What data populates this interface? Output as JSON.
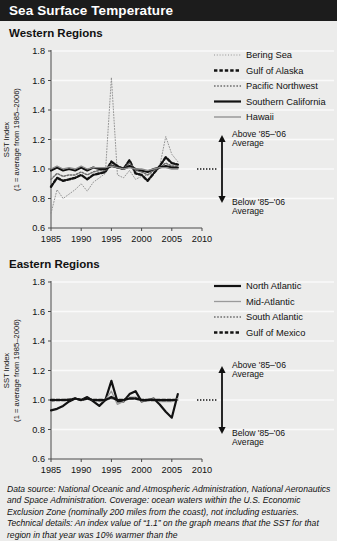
{
  "header": {
    "title": "Sea Surface Temperature"
  },
  "sections": {
    "west": "Western Regions",
    "east": "Eastern Regions"
  },
  "annotations": {
    "above_line1": "Above '85–'06",
    "above_line2": "Average",
    "below_line1": "Below '85–'06",
    "below_line2": "Average"
  },
  "axis": {
    "ylabel_line1": "SST Index",
    "ylabel_line2": "(1 = average from 1985–2006)",
    "yticks": [
      "1.8",
      "1.6",
      "1.4",
      "1.2",
      "1.0",
      "0.8",
      "0.6"
    ],
    "xticks": [
      "1985",
      "1990",
      "1995",
      "2000",
      "2005",
      "2010"
    ]
  },
  "footnote": "Data source: National Oceanic and Atmospheric Administration, National Aeronautics and Space Administration. Coverage: ocean waters within the U.S. Economic Exclusion Zone (nominally 200 miles from the coast), not including estuaries. Technical details: An index value of “1.1” on the graph means that the SST for that region in that year was 10% warmer than the",
  "chart_data": [
    {
      "type": "line",
      "title": "Western Regions",
      "xlabel": "",
      "ylabel": "SST Index (1 = average from 1985–2006)",
      "xlim": [
        1985,
        2010
      ],
      "ylim": [
        0.6,
        1.8
      ],
      "yticks": [
        0.6,
        0.8,
        1.0,
        1.2,
        1.4,
        1.6,
        1.8
      ],
      "xticks": [
        1985,
        1990,
        1995,
        2000,
        2005,
        2010
      ],
      "grid": "horizontal",
      "legend_position": "top-right",
      "reference_line": 1.0,
      "x": [
        1985,
        1986,
        1987,
        1988,
        1989,
        1990,
        1991,
        1992,
        1993,
        1994,
        1995,
        1996,
        1997,
        1998,
        1999,
        2000,
        2001,
        2002,
        2003,
        2004,
        2005,
        2006
      ],
      "series": [
        {
          "name": "Bering Sea",
          "style": "fine-dotted",
          "color": "#8b8b8b",
          "values": [
            0.7,
            0.86,
            0.8,
            0.83,
            0.86,
            0.9,
            0.85,
            0.91,
            0.94,
            0.97,
            1.62,
            0.96,
            0.94,
            0.99,
            0.93,
            0.95,
            0.96,
            0.97,
            1.02,
            1.22,
            1.1,
            1.05
          ]
        },
        {
          "name": "Gulf of Alaska",
          "style": "thick-dashed",
          "color": "#121212",
          "values": [
            0.88,
            0.94,
            0.92,
            0.93,
            0.94,
            0.96,
            0.93,
            0.96,
            0.97,
            0.98,
            1.05,
            1.02,
            1.0,
            1.06,
            0.97,
            0.96,
            0.92,
            0.97,
            1.02,
            1.08,
            1.04,
            1.03
          ]
        },
        {
          "name": "Pacific Northwest",
          "style": "dot-dash",
          "color": "#6e6e6e",
          "values": [
            0.93,
            0.97,
            0.95,
            0.96,
            0.96,
            0.98,
            0.96,
            0.98,
            0.99,
            0.99,
            1.03,
            1.01,
            1.0,
            1.04,
            0.99,
            0.98,
            0.96,
            0.99,
            1.01,
            1.04,
            1.02,
            1.02
          ]
        },
        {
          "name": "Southern California",
          "style": "thick-solid",
          "color": "#121212",
          "values": [
            0.99,
            1.01,
            0.99,
            1.0,
            0.99,
            1.01,
            0.99,
            1.01,
            1.0,
            1.0,
            1.02,
            1.01,
            1.0,
            1.02,
            1.0,
            0.99,
            0.98,
            1.0,
            1.01,
            1.02,
            1.01,
            1.01
          ]
        },
        {
          "name": "Hawaii",
          "style": "solid-mid",
          "color": "#8d8d8d",
          "values": [
            1.0,
            1.02,
            1.0,
            1.01,
            1.0,
            1.02,
            1.0,
            1.01,
            1.01,
            1.01,
            1.02,
            1.01,
            1.0,
            1.01,
            1.0,
            1.0,
            0.99,
            1.0,
            1.01,
            1.01,
            1.0,
            1.0
          ]
        }
      ]
    },
    {
      "type": "line",
      "title": "Eastern Regions",
      "xlabel": "",
      "ylabel": "SST Index (1 = average from 1985–2006)",
      "xlim": [
        1985,
        2010
      ],
      "ylim": [
        0.6,
        1.8
      ],
      "yticks": [
        0.6,
        0.8,
        1.0,
        1.2,
        1.4,
        1.6,
        1.8
      ],
      "xticks": [
        1985,
        1990,
        1995,
        2000,
        2005,
        2010
      ],
      "grid": "horizontal",
      "legend_position": "top-right",
      "reference_line": 1.0,
      "x": [
        1985,
        1986,
        1987,
        1988,
        1989,
        1990,
        1991,
        1992,
        1993,
        1994,
        1995,
        1996,
        1997,
        1998,
        1999,
        2000,
        2001,
        2002,
        2003,
        2004,
        2005,
        2006
      ],
      "series": [
        {
          "name": "North Atlantic",
          "style": "thick-solid",
          "color": "#121212",
          "values": [
            0.93,
            0.94,
            0.96,
            0.99,
            1.01,
            1.0,
            1.02,
            0.99,
            0.96,
            1.0,
            1.13,
            0.99,
            0.99,
            1.04,
            1.06,
            0.99,
            1.0,
            1.01,
            0.97,
            0.92,
            0.88,
            1.04
          ]
        },
        {
          "name": "Mid-Atlantic",
          "style": "solid-gray",
          "color": "#9a9a9a",
          "values": [
            0.99,
            1.0,
            1.0,
            1.01,
            1.01,
            1.0,
            1.01,
            1.0,
            0.99,
            1.0,
            1.06,
            0.97,
            0.99,
            1.02,
            1.02,
            0.99,
            1.0,
            1.01,
            0.99,
            0.99,
            0.99,
            1.01
          ]
        },
        {
          "name": "South Atlantic",
          "style": "dot-dash",
          "color": "#6e6e6e",
          "values": [
            1.0,
            1.0,
            1.0,
            1.0,
            1.01,
            1.0,
            1.01,
            1.0,
            1.0,
            1.0,
            1.01,
            1.0,
            1.0,
            1.01,
            1.01,
            1.0,
            1.0,
            1.0,
            1.0,
            1.0,
            1.0,
            1.0
          ]
        },
        {
          "name": "Gulf of Mexico",
          "style": "thick-dashed",
          "color": "#121212",
          "values": [
            1.0,
            1.0,
            1.0,
            1.0,
            1.01,
            1.0,
            1.01,
            1.0,
            1.0,
            1.0,
            1.02,
            1.0,
            1.0,
            1.01,
            1.01,
            1.0,
            1.0,
            1.0,
            1.0,
            1.0,
            1.0,
            1.0
          ]
        }
      ]
    }
  ]
}
